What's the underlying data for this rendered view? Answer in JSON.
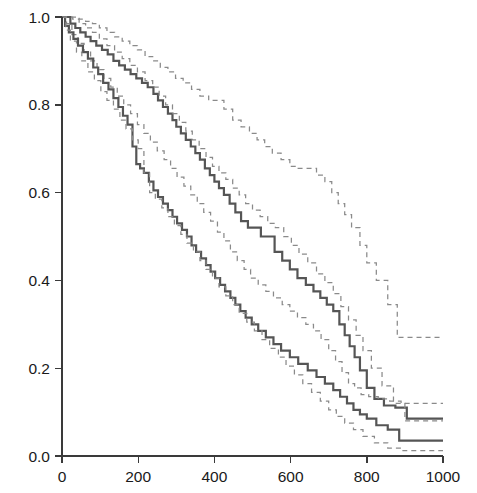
{
  "figure": {
    "name": "kaplan-meier-survival-plot",
    "background_color": "#ffffff",
    "width": 477,
    "height": 493
  },
  "style": {
    "solid_curve_color": "#555555",
    "ci_curve_color": "#8a8a8a",
    "axis_color": "#3a3a3a",
    "text_color": "#1a1a1a"
  },
  "axes": {
    "x": {
      "label": "",
      "ticks": [
        "0",
        "200",
        "400",
        "600",
        "800",
        "1000"
      ],
      "tick_values": [
        0,
        200,
        400,
        600,
        800,
        1000
      ],
      "range": [
        0,
        1040
      ],
      "pixel_start": 62,
      "pixel_end": 443
    },
    "y": {
      "label": "",
      "ticks": [
        "0.0",
        "0.2",
        "0.4",
        "0.6",
        "0.8",
        "1.0"
      ],
      "tick_values": [
        0.0,
        0.2,
        0.4,
        0.6,
        0.8,
        1.0
      ],
      "range": [
        0,
        1.0
      ],
      "pixel_top": 17,
      "pixel_bottom": 456
    }
  },
  "chart_data": {
    "type": "line",
    "title": "",
    "subtitle": "",
    "xlabel": "",
    "ylabel": "",
    "xlim": [
      0,
      1040
    ],
    "ylim": [
      0,
      1.0
    ],
    "grid": false,
    "legend": null,
    "step_style": "post",
    "series": [
      {
        "name": "Group 1 (upper survival curve)",
        "style": "solid",
        "color": "#555555",
        "x": [
          0,
          10,
          22,
          35,
          48,
          62,
          75,
          90,
          105,
          120,
          135,
          150,
          165,
          180,
          195,
          210,
          225,
          240,
          252,
          265,
          278,
          290,
          300,
          312,
          325,
          338,
          350,
          362,
          375,
          388,
          400,
          412,
          425,
          440,
          455,
          470,
          488,
          505,
          522,
          540,
          558,
          578,
          598,
          618,
          640,
          660,
          678,
          695,
          712,
          728,
          742,
          755,
          768,
          782,
          800,
          820,
          845,
          875,
          905,
          1000
        ],
        "y": [
          1.0,
          1.0,
          0.985,
          0.975,
          0.965,
          0.955,
          0.945,
          0.935,
          0.925,
          0.915,
          0.9,
          0.89,
          0.88,
          0.87,
          0.86,
          0.85,
          0.84,
          0.825,
          0.81,
          0.795,
          0.78,
          0.765,
          0.75,
          0.735,
          0.72,
          0.705,
          0.69,
          0.675,
          0.655,
          0.64,
          0.625,
          0.61,
          0.595,
          0.575,
          0.555,
          0.535,
          0.52,
          0.52,
          0.5,
          0.5,
          0.465,
          0.445,
          0.425,
          0.405,
          0.39,
          0.375,
          0.36,
          0.345,
          0.33,
          0.3,
          0.275,
          0.25,
          0.225,
          0.195,
          0.155,
          0.13,
          0.115,
          0.11,
          0.085,
          0.085
        ]
      },
      {
        "name": "Group 1 upper 95% CI",
        "style": "dashed",
        "color": "#8a8a8a",
        "x": [
          0,
          15,
          30,
          45,
          62,
          80,
          98,
          118,
          138,
          158,
          178,
          198,
          218,
          238,
          258,
          278,
          298,
          318,
          340,
          362,
          385,
          405,
          425,
          448,
          470,
          492,
          512,
          532,
          552,
          575,
          598,
          620,
          645,
          668,
          690,
          708,
          725,
          742,
          760,
          782,
          800,
          825,
          855,
          880,
          1000
        ],
        "y": [
          1.0,
          1.0,
          1.0,
          0.995,
          0.99,
          0.985,
          0.975,
          0.965,
          0.955,
          0.945,
          0.935,
          0.925,
          0.91,
          0.9,
          0.885,
          0.875,
          0.86,
          0.85,
          0.835,
          0.82,
          0.81,
          0.81,
          0.79,
          0.765,
          0.75,
          0.735,
          0.72,
          0.705,
          0.69,
          0.675,
          0.66,
          0.655,
          0.655,
          0.64,
          0.625,
          0.6,
          0.575,
          0.55,
          0.52,
          0.48,
          0.44,
          0.4,
          0.345,
          0.27,
          0.27
        ]
      },
      {
        "name": "Group 1 lower 95% CI",
        "style": "dashed",
        "color": "#8a8a8a",
        "x": [
          0,
          12,
          26,
          42,
          58,
          75,
          92,
          110,
          128,
          145,
          162,
          180,
          198,
          215,
          232,
          250,
          268,
          285,
          302,
          320,
          338,
          355,
          372,
          390,
          408,
          425,
          442,
          460,
          478,
          495,
          515,
          535,
          555,
          578,
          598,
          618,
          640,
          660,
          680,
          700,
          718,
          735,
          752,
          768,
          785,
          805,
          830,
          860,
          890,
          1000
        ],
        "y": [
          1.0,
          0.985,
          0.96,
          0.94,
          0.92,
          0.9,
          0.88,
          0.86,
          0.84,
          0.82,
          0.8,
          0.78,
          0.755,
          0.735,
          0.715,
          0.695,
          0.675,
          0.655,
          0.635,
          0.615,
          0.595,
          0.575,
          0.555,
          0.535,
          0.51,
          0.49,
          0.465,
          0.445,
          0.425,
          0.405,
          0.39,
          0.375,
          0.36,
          0.345,
          0.33,
          0.315,
          0.3,
          0.285,
          0.265,
          0.24,
          0.215,
          0.19,
          0.165,
          0.155,
          0.14,
          0.135,
          0.13,
          0.125,
          0.12,
          0.12
        ]
      },
      {
        "name": "Group 2 (lower survival curve)",
        "style": "solid",
        "color": "#555555",
        "x": [
          0,
          8,
          18,
          30,
          42,
          55,
          68,
          82,
          95,
          108,
          122,
          135,
          148,
          160,
          172,
          185,
          195,
          205,
          215,
          228,
          240,
          252,
          265,
          278,
          290,
          302,
          315,
          328,
          340,
          352,
          365,
          378,
          390,
          402,
          415,
          428,
          442,
          455,
          468,
          482,
          498,
          515,
          535,
          555,
          575,
          598,
          620,
          645,
          668,
          690,
          712,
          730,
          748,
          765,
          782,
          800,
          825,
          855,
          885,
          1000
        ],
        "y": [
          1.0,
          0.98,
          0.965,
          0.95,
          0.935,
          0.92,
          0.905,
          0.885,
          0.87,
          0.85,
          0.835,
          0.815,
          0.795,
          0.775,
          0.755,
          0.705,
          0.665,
          0.655,
          0.645,
          0.625,
          0.605,
          0.59,
          0.575,
          0.56,
          0.545,
          0.53,
          0.515,
          0.5,
          0.48,
          0.465,
          0.45,
          0.435,
          0.42,
          0.405,
          0.39,
          0.375,
          0.36,
          0.345,
          0.33,
          0.315,
          0.3,
          0.285,
          0.27,
          0.255,
          0.24,
          0.225,
          0.21,
          0.195,
          0.18,
          0.165,
          0.15,
          0.135,
          0.12,
          0.105,
          0.095,
          0.085,
          0.07,
          0.06,
          0.035,
          0.035
        ]
      },
      {
        "name": "Group 2 upper 95% CI",
        "style": "dashed",
        "color": "#8a8a8a",
        "x": [
          0,
          12,
          28,
          45,
          62,
          80,
          98,
          118,
          138,
          158,
          178,
          198,
          218,
          238,
          255,
          272,
          290,
          308,
          325,
          342,
          360,
          378,
          395,
          412,
          430,
          448,
          465,
          482,
          500,
          520,
          540,
          560,
          582,
          602,
          622,
          645,
          668,
          690,
          712,
          732,
          752,
          772,
          790,
          812,
          840,
          870,
          900,
          1000
        ],
        "y": [
          1.0,
          1.0,
          0.995,
          0.985,
          0.975,
          0.965,
          0.95,
          0.935,
          0.92,
          0.905,
          0.89,
          0.875,
          0.855,
          0.84,
          0.82,
          0.8,
          0.78,
          0.76,
          0.74,
          0.72,
          0.7,
          0.68,
          0.66,
          0.645,
          0.63,
          0.61,
          0.595,
          0.575,
          0.56,
          0.545,
          0.53,
          0.52,
          0.5,
          0.48,
          0.46,
          0.44,
          0.415,
          0.395,
          0.37,
          0.34,
          0.31,
          0.275,
          0.24,
          0.2,
          0.16,
          0.12,
          0.08,
          0.08
        ]
      },
      {
        "name": "Group 2 lower 95% CI",
        "style": "dashed",
        "color": "#8a8a8a",
        "x": [
          0,
          10,
          22,
          38,
          52,
          68,
          85,
          102,
          118,
          135,
          152,
          168,
          185,
          200,
          215,
          230,
          245,
          262,
          278,
          295,
          312,
          328,
          345,
          362,
          378,
          395,
          412,
          430,
          448,
          465,
          485,
          505,
          525,
          545,
          568,
          588,
          610,
          632,
          655,
          678,
          700,
          720,
          742,
          765,
          790,
          820,
          855,
          895,
          1000
        ],
        "y": [
          1.0,
          0.97,
          0.945,
          0.92,
          0.9,
          0.875,
          0.855,
          0.83,
          0.81,
          0.79,
          0.765,
          0.745,
          0.72,
          0.7,
          0.645,
          0.6,
          0.585,
          0.565,
          0.545,
          0.525,
          0.505,
          0.485,
          0.465,
          0.445,
          0.425,
          0.405,
          0.385,
          0.365,
          0.345,
          0.325,
          0.305,
          0.285,
          0.265,
          0.245,
          0.225,
          0.205,
          0.185,
          0.165,
          0.145,
          0.125,
          0.105,
          0.09,
          0.075,
          0.06,
          0.045,
          0.03,
          0.018,
          0.012,
          0.012
        ]
      }
    ]
  }
}
